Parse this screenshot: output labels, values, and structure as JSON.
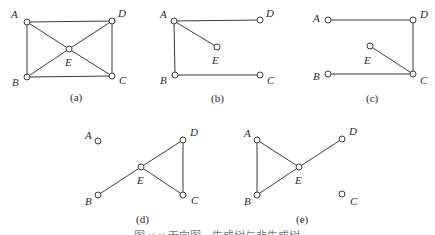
{
  "figure": {
    "caption": "图 x-x 无向图、生成树与非生成树",
    "node_radius": 3,
    "colors": {
      "stroke": "#3a3a3a",
      "node_fill": "#ffffff",
      "text": "#2a2a2a",
      "caption": "#777777"
    },
    "panels": [
      {
        "id": "a",
        "label": "(a)",
        "label_pos": [
          70,
          101
        ],
        "nodes": [
          {
            "name": "A",
            "x": 27,
            "y": 22,
            "lx": 11,
            "ly": 18
          },
          {
            "name": "D",
            "x": 112,
            "y": 21,
            "lx": 118,
            "ly": 17
          },
          {
            "name": "E",
            "x": 69,
            "y": 49,
            "lx": 65,
            "ly": 66
          },
          {
            "name": "B",
            "x": 27,
            "y": 77,
            "lx": 12,
            "ly": 86
          },
          {
            "name": "C",
            "x": 112,
            "y": 76,
            "lx": 119,
            "ly": 84
          }
        ],
        "edges": [
          [
            "A",
            "D"
          ],
          [
            "A",
            "B"
          ],
          [
            "D",
            "C"
          ],
          [
            "B",
            "C"
          ],
          [
            "A",
            "E"
          ],
          [
            "E",
            "C"
          ],
          [
            "D",
            "E"
          ],
          [
            "E",
            "B"
          ]
        ]
      },
      {
        "id": "b",
        "label": "(b)",
        "label_pos": [
          211,
          102
        ],
        "nodes": [
          {
            "name": "A",
            "x": 174,
            "y": 21,
            "lx": 160,
            "ly": 18
          },
          {
            "name": "D",
            "x": 260,
            "y": 20,
            "lx": 266,
            "ly": 17
          },
          {
            "name": "E",
            "x": 217,
            "y": 47,
            "lx": 212,
            "ly": 64
          },
          {
            "name": "B",
            "x": 175,
            "y": 75,
            "lx": 160,
            "ly": 84
          },
          {
            "name": "C",
            "x": 260,
            "y": 75,
            "lx": 267,
            "ly": 84
          }
        ],
        "edges": [
          [
            "A",
            "D"
          ],
          [
            "A",
            "E"
          ],
          [
            "A",
            "B"
          ],
          [
            "B",
            "C"
          ]
        ]
      },
      {
        "id": "c",
        "label": "(c)",
        "label_pos": [
          366,
          102
        ],
        "nodes": [
          {
            "name": "A",
            "x": 328,
            "y": 20,
            "lx": 313,
            "ly": 22
          },
          {
            "name": "D",
            "x": 413,
            "y": 20,
            "lx": 420,
            "ly": 18
          },
          {
            "name": "E",
            "x": 370,
            "y": 46,
            "lx": 364,
            "ly": 64
          },
          {
            "name": "B",
            "x": 328,
            "y": 74,
            "lx": 313,
            "ly": 80
          },
          {
            "name": "C",
            "x": 413,
            "y": 74,
            "lx": 420,
            "ly": 84
          }
        ],
        "edges": [
          [
            "A",
            "D"
          ],
          [
            "D",
            "C"
          ],
          [
            "E",
            "C"
          ],
          [
            "B",
            "C"
          ]
        ]
      },
      {
        "id": "d",
        "label": "(d)",
        "label_pos": [
          136,
          223
        ],
        "nodes": [
          {
            "name": "A",
            "x": 98,
            "y": 141,
            "lx": 85,
            "ly": 139
          },
          {
            "name": "D",
            "x": 183,
            "y": 140,
            "lx": 190,
            "ly": 136
          },
          {
            "name": "E",
            "x": 141,
            "y": 167,
            "lx": 137,
            "ly": 184
          },
          {
            "name": "B",
            "x": 98,
            "y": 195,
            "lx": 85,
            "ly": 205
          },
          {
            "name": "C",
            "x": 183,
            "y": 195,
            "lx": 191,
            "ly": 204
          }
        ],
        "edges": [
          [
            "B",
            "E"
          ],
          [
            "E",
            "D"
          ],
          [
            "E",
            "C"
          ],
          [
            "D",
            "C"
          ]
        ]
      },
      {
        "id": "e",
        "label": "(e)",
        "label_pos": [
          296,
          223
        ],
        "nodes": [
          {
            "name": "A",
            "x": 257,
            "y": 140,
            "lx": 244,
            "ly": 137
          },
          {
            "name": "D",
            "x": 342,
            "y": 139,
            "lx": 349,
            "ly": 135
          },
          {
            "name": "E",
            "x": 299,
            "y": 167,
            "lx": 295,
            "ly": 184
          },
          {
            "name": "B",
            "x": 257,
            "y": 195,
            "lx": 244,
            "ly": 205
          },
          {
            "name": "C",
            "x": 342,
            "y": 194,
            "lx": 350,
            "ly": 205
          }
        ],
        "edges": [
          [
            "A",
            "B"
          ],
          [
            "A",
            "E"
          ],
          [
            "B",
            "E"
          ],
          [
            "E",
            "D"
          ]
        ]
      }
    ]
  }
}
